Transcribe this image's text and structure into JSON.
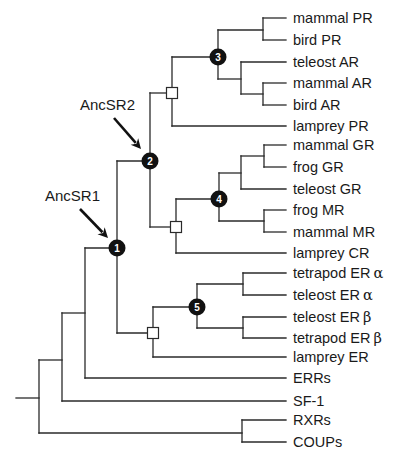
{
  "diagram": {
    "type": "phylogenetic-tree",
    "colors": {
      "line": "#2a2a2a",
      "node_fill": "#111111",
      "node_text": "#ffffff",
      "square_fill": "#ffffff"
    },
    "annotations": [
      {
        "label": "AncSR1",
        "text_x": 45,
        "text_y": 201,
        "arrow": {
          "x1": 80,
          "y1": 209,
          "x2": 108,
          "y2": 238
        }
      },
      {
        "label": "AncSR2",
        "text_x": 80,
        "text_y": 110,
        "arrow": {
          "x1": 114,
          "y1": 118,
          "x2": 141,
          "y2": 149
        }
      }
    ],
    "numbered_nodes": [
      {
        "number": "1",
        "x": 117,
        "y": 248
      },
      {
        "number": "2",
        "x": 150,
        "y": 161
      },
      {
        "number": "3",
        "x": 218,
        "y": 57
      },
      {
        "number": "4",
        "x": 219,
        "y": 199
      },
      {
        "number": "5",
        "x": 197,
        "y": 307
      }
    ],
    "square_nodes": [
      {
        "x": 172,
        "y": 93
      },
      {
        "x": 176,
        "y": 227
      },
      {
        "x": 153,
        "y": 333
      }
    ],
    "leaves": [
      {
        "name": "mammal PR",
        "y": 18,
        "x_start": 263
      },
      {
        "name": "bird PR",
        "y": 40,
        "x_start": 263
      },
      {
        "name": "teleost AR",
        "y": 62,
        "x_start": 241
      },
      {
        "name": "mammal AR",
        "y": 83,
        "x_start": 263
      },
      {
        "name": "bird AR",
        "y": 105,
        "x_start": 263
      },
      {
        "name": "lamprey PR",
        "y": 126,
        "x_start": 172
      },
      {
        "name": "mammal GR",
        "y": 145,
        "x_start": 264
      },
      {
        "name": "frog GR",
        "y": 167,
        "x_start": 264
      },
      {
        "name": "teleost GR",
        "y": 189,
        "x_start": 241
      },
      {
        "name": "frog MR",
        "y": 210,
        "x_start": 264
      },
      {
        "name": "mammal MR",
        "y": 232,
        "x_start": 264
      },
      {
        "name": "lamprey CR",
        "y": 253,
        "x_start": 176
      },
      {
        "name": "tetrapod ER",
        "suffix": "α",
        "y": 273,
        "x_start": 243
      },
      {
        "name": "teleost ER",
        "suffix": "α",
        "y": 295,
        "x_start": 243
      },
      {
        "name": "teleost ER",
        "suffix": "β",
        "y": 317,
        "x_start": 243
      },
      {
        "name": "tetrapod ER",
        "suffix": "β",
        "y": 338,
        "x_start": 243
      },
      {
        "name": "lamprey ER",
        "y": 357,
        "x_start": 153
      },
      {
        "name": "ERRs",
        "y": 378,
        "x_start": 85
      },
      {
        "name": "SF-1",
        "y": 401,
        "x_start": 62
      },
      {
        "name": "RXRs",
        "y": 420,
        "x_start": 242
      },
      {
        "name": "COUPs",
        "y": 442,
        "x_start": 242
      }
    ],
    "leaf_end_x": 286,
    "label_x": 293,
    "internal_segments": [
      [
        263,
        18,
        263,
        40
      ],
      [
        218,
        30,
        263,
        30
      ],
      [
        263,
        83,
        263,
        105
      ],
      [
        241,
        94,
        263,
        94
      ],
      [
        241,
        62,
        241,
        94
      ],
      [
        218,
        79,
        241,
        79
      ],
      [
        218,
        30,
        218,
        79
      ],
      [
        172,
        57,
        218,
        57
      ],
      [
        172,
        57,
        172,
        126
      ],
      [
        150,
        93,
        172,
        93
      ],
      [
        264,
        145,
        264,
        167
      ],
      [
        241,
        156,
        264,
        156
      ],
      [
        241,
        156,
        241,
        189
      ],
      [
        219,
        173,
        241,
        173
      ],
      [
        264,
        210,
        264,
        232
      ],
      [
        219,
        221,
        264,
        221
      ],
      [
        219,
        173,
        219,
        221
      ],
      [
        176,
        199,
        219,
        199
      ],
      [
        176,
        199,
        176,
        253
      ],
      [
        150,
        227,
        176,
        227
      ],
      [
        150,
        93,
        150,
        227
      ],
      [
        117,
        161,
        150,
        161
      ],
      [
        243,
        273,
        243,
        295
      ],
      [
        197,
        284,
        243,
        284
      ],
      [
        243,
        317,
        243,
        338
      ],
      [
        197,
        328,
        243,
        328
      ],
      [
        197,
        284,
        197,
        328
      ],
      [
        153,
        307,
        197,
        307
      ],
      [
        153,
        307,
        153,
        357
      ],
      [
        117,
        333,
        153,
        333
      ],
      [
        117,
        161,
        117,
        333
      ],
      [
        85,
        248,
        117,
        248
      ],
      [
        85,
        248,
        85,
        378
      ],
      [
        62,
        313,
        85,
        313
      ],
      [
        62,
        313,
        62,
        401
      ],
      [
        39,
        360,
        62,
        360
      ],
      [
        242,
        420,
        242,
        442
      ],
      [
        39,
        433,
        242,
        433
      ],
      [
        39,
        360,
        39,
        433
      ],
      [
        16,
        398,
        39,
        398
      ]
    ]
  }
}
